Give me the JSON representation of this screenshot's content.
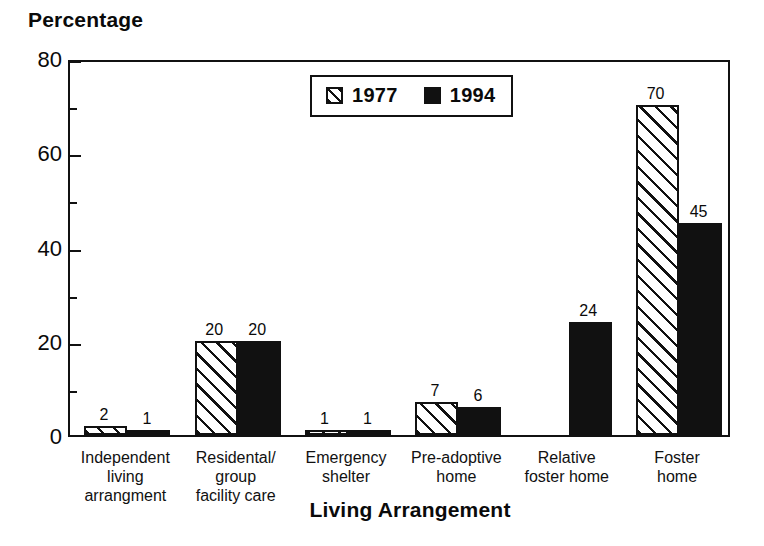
{
  "chart_data": {
    "type": "bar",
    "title": "",
    "ylabel": "Percentage",
    "xlabel": "Living Arrangement",
    "ylim": [
      0,
      80
    ],
    "yticks": [
      0,
      20,
      40,
      60,
      80
    ],
    "ytick_labels": [
      "0",
      "20",
      "40",
      "60",
      "80"
    ],
    "minor_tick_step": 10,
    "grid": false,
    "legend_position": "top-center",
    "categories": [
      "Independent\nliving\narrangment",
      "Residental/\ngroup\nfacility care",
      "Emergency\nshelter",
      "Pre-adoptive\nhome",
      "Relative\nfoster home",
      "Foster\nhome"
    ],
    "series": [
      {
        "name": "1977",
        "fill": "hatched",
        "color": "#ffffff",
        "values": [
          2,
          20,
          1,
          7,
          null,
          70
        ],
        "value_labels": [
          "2",
          "20",
          "1",
          "7",
          "",
          "70"
        ]
      },
      {
        "name": "1994",
        "fill": "solid",
        "color": "#111111",
        "values": [
          1,
          20,
          1,
          6,
          24,
          45
        ],
        "value_labels": [
          "1",
          "20",
          "1",
          "6",
          "24",
          "45"
        ]
      }
    ]
  },
  "legend": {
    "entries": [
      {
        "label": "1977",
        "swatch": "hatched-swatch-icon"
      },
      {
        "label": "1994",
        "swatch": "solid-black-swatch-icon"
      }
    ]
  },
  "colors": {
    "ink": "#111111",
    "paper": "#ffffff"
  }
}
